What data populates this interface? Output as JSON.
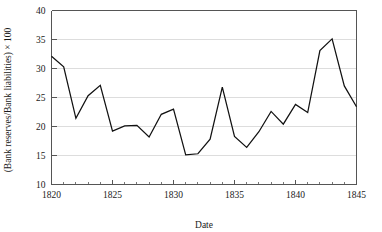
{
  "chart_data": {
    "type": "line",
    "title": "",
    "subtitle": "",
    "xlabel": "Date",
    "ylabel": "(Bank reserves/Bank liabilities) × 100",
    "xlim": [
      1820,
      1845
    ],
    "ylim": [
      10,
      40
    ],
    "grid": true,
    "legend": "none",
    "x_major_ticks": [
      1820,
      1825,
      1830,
      1835,
      1840,
      1845
    ],
    "x_major_tick_labels": [
      "1820",
      "1825",
      "1830",
      "1835",
      "1840",
      "1845"
    ],
    "x_minor_tick_interval": 1,
    "y_major_ticks": [
      10,
      15,
      20,
      25,
      30,
      35,
      40
    ],
    "y_major_tick_labels": [
      "10",
      "15",
      "20",
      "25",
      "30",
      "35",
      "40"
    ],
    "x": [
      1820,
      1821,
      1822,
      1823,
      1824,
      1825,
      1826,
      1827,
      1828,
      1829,
      1830,
      1831,
      1832,
      1833,
      1834,
      1835,
      1836,
      1837,
      1838,
      1839,
      1840,
      1841,
      1842,
      1843,
      1844,
      1845
    ],
    "values": [
      32.1,
      30.3,
      21.4,
      25.3,
      27.1,
      19.2,
      20.1,
      20.2,
      18.2,
      22.1,
      23.0,
      15.1,
      15.3,
      17.8,
      26.8,
      18.3,
      16.4,
      19.1,
      22.6,
      20.4,
      23.8,
      22.4,
      33.1,
      35.1,
      27.0,
      23.4
    ],
    "series": [
      {
        "name": "Bank reserve ratio",
        "color": "#111111",
        "values": [
          32.1,
          30.3,
          21.4,
          25.3,
          27.1,
          19.2,
          20.1,
          20.2,
          18.2,
          22.1,
          23.0,
          15.1,
          15.3,
          17.8,
          26.8,
          18.3,
          16.4,
          19.1,
          22.6,
          20.4,
          23.8,
          22.4,
          33.1,
          35.1,
          27.0,
          23.4
        ]
      }
    ]
  },
  "colors": {
    "line": "#111111",
    "grid": "#cfcfcf",
    "axis": "#555555",
    "background": "#ffffff"
  }
}
